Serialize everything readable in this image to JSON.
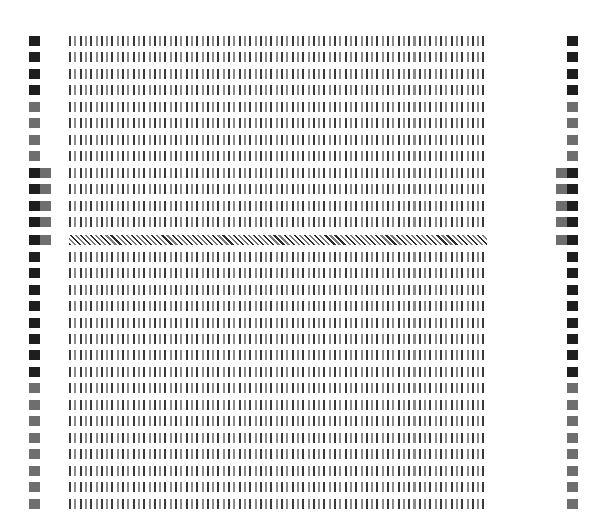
{
  "pattern": {
    "colors": {
      "dark": "#1e1e1e",
      "gray": "#6e6e6e",
      "stripe_dark": "#3a3a3a",
      "stripe_light": "#8a8a8a"
    },
    "rows": [
      {
        "y": 36,
        "left": [
          "dark"
        ],
        "right": [
          "dark"
        ],
        "fill": "stripes"
      },
      {
        "y": 52,
        "left": [
          "dark"
        ],
        "right": [
          "dark"
        ],
        "fill": "stripes"
      },
      {
        "y": 69,
        "left": [
          "dark"
        ],
        "right": [
          "dark"
        ],
        "fill": "stripes"
      },
      {
        "y": 85,
        "left": [
          "dark"
        ],
        "right": [
          "dark"
        ],
        "fill": "stripes"
      },
      {
        "y": 102,
        "left": [
          "gray"
        ],
        "right": [
          "gray"
        ],
        "fill": "stripes"
      },
      {
        "y": 118,
        "left": [
          "gray"
        ],
        "right": [
          "gray"
        ],
        "fill": "stripes"
      },
      {
        "y": 135,
        "left": [
          "gray"
        ],
        "right": [
          "gray"
        ],
        "fill": "stripes"
      },
      {
        "y": 151,
        "left": [
          "gray"
        ],
        "right": [
          "gray"
        ],
        "fill": "stripes"
      },
      {
        "y": 168,
        "left": [
          "dark",
          "gray"
        ],
        "right": [
          "gray",
          "dark"
        ],
        "fill": "stripes"
      },
      {
        "y": 184,
        "left": [
          "dark",
          "gray"
        ],
        "right": [
          "gray",
          "dark"
        ],
        "fill": "stripes"
      },
      {
        "y": 201,
        "left": [
          "dark",
          "gray"
        ],
        "right": [
          "gray",
          "dark"
        ],
        "fill": "stripes"
      },
      {
        "y": 217,
        "left": [
          "dark",
          "gray"
        ],
        "right": [
          "gray",
          "dark"
        ],
        "fill": "stripes"
      },
      {
        "y": 235,
        "left": [
          "dark",
          "gray"
        ],
        "right": [
          "gray",
          "dark"
        ],
        "fill": "hatch"
      },
      {
        "y": 252,
        "left": [
          "dark"
        ],
        "right": [
          "dark"
        ],
        "fill": "stripes"
      },
      {
        "y": 268,
        "left": [
          "dark"
        ],
        "right": [
          "dark"
        ],
        "fill": "stripes"
      },
      {
        "y": 285,
        "left": [
          "dark"
        ],
        "right": [
          "dark"
        ],
        "fill": "stripes"
      },
      {
        "y": 301,
        "left": [
          "dark"
        ],
        "right": [
          "dark"
        ],
        "fill": "stripes"
      },
      {
        "y": 318,
        "left": [
          "dark"
        ],
        "right": [
          "dark"
        ],
        "fill": "stripes"
      },
      {
        "y": 334,
        "left": [
          "dark"
        ],
        "right": [
          "dark"
        ],
        "fill": "stripes"
      },
      {
        "y": 350,
        "left": [
          "dark"
        ],
        "right": [
          "dark"
        ],
        "fill": "stripes"
      },
      {
        "y": 367,
        "left": [
          "dark"
        ],
        "right": [
          "dark"
        ],
        "fill": "stripes"
      },
      {
        "y": 383,
        "left": [
          "gray"
        ],
        "right": [
          "gray"
        ],
        "fill": "stripes"
      },
      {
        "y": 400,
        "left": [
          "gray"
        ],
        "right": [
          "gray"
        ],
        "fill": "stripes"
      },
      {
        "y": 416,
        "left": [
          "gray"
        ],
        "right": [
          "gray"
        ],
        "fill": "stripes"
      },
      {
        "y": 433,
        "left": [
          "gray"
        ],
        "right": [
          "gray"
        ],
        "fill": "stripes"
      },
      {
        "y": 449,
        "left": [
          "gray"
        ],
        "right": [
          "gray"
        ],
        "fill": "stripes"
      },
      {
        "y": 466,
        "left": [
          "gray"
        ],
        "right": [
          "gray"
        ],
        "fill": "stripes"
      },
      {
        "y": 482,
        "left": [
          "gray"
        ],
        "right": [
          "gray"
        ],
        "fill": "stripes"
      },
      {
        "y": 499,
        "left": [
          "gray"
        ],
        "right": [
          "gray"
        ],
        "fill": "stripes"
      }
    ]
  }
}
